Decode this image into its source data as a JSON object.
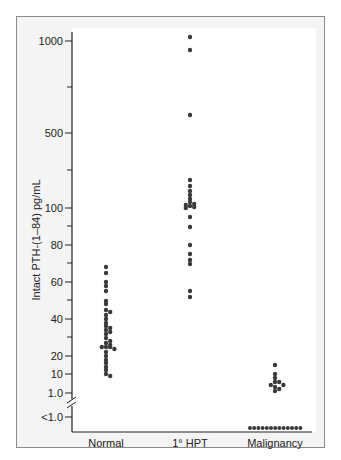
{
  "chart_data": {
    "type": "scatter",
    "subtype": "dot-plot",
    "title": "",
    "xlabel": "",
    "ylabel": "Intact PTH-(1–84) pg/mL",
    "categories": [
      "Normal",
      "1° HPT",
      "Malignancy"
    ],
    "y_ticks": [
      {
        "label": "1000",
        "y": 41
      },
      {
        "label": "500",
        "y": 133
      },
      {
        "label": "100",
        "y": 208
      },
      {
        "label": "80",
        "y": 245
      },
      {
        "label": "60",
        "y": 282
      },
      {
        "label": "40",
        "y": 319
      },
      {
        "label": "20",
        "y": 356
      },
      {
        "label": "10",
        "y": 374
      },
      {
        "label": "1.0",
        "y": 393
      },
      {
        "label": "<1.0",
        "y": 417
      }
    ],
    "axis_break": true,
    "grid": false,
    "legend": null,
    "series": [
      {
        "name": "Normal",
        "approx_values": [
          68,
          65,
          60,
          58,
          55,
          50,
          48,
          45,
          44,
          42,
          40,
          38,
          36,
          35,
          34,
          33,
          32,
          30,
          28,
          27,
          26,
          25,
          25,
          25,
          24,
          22,
          20,
          18,
          16,
          14,
          12,
          10,
          9
        ],
        "median_approx": 25
      },
      {
        "name": "1° HPT",
        "approx_values": [
          1050,
          950,
          600,
          250,
          220,
          190,
          170,
          150,
          130,
          120,
          115,
          110,
          105,
          100,
          95,
          90,
          80,
          75,
          72,
          70,
          55,
          52
        ],
        "median_approx": 110
      },
      {
        "name": "Malignancy",
        "approx_values": [
          15,
          10,
          8,
          6,
          6,
          5,
          5,
          4,
          3,
          2
        ],
        "below_detection_count": 13
      }
    ]
  }
}
